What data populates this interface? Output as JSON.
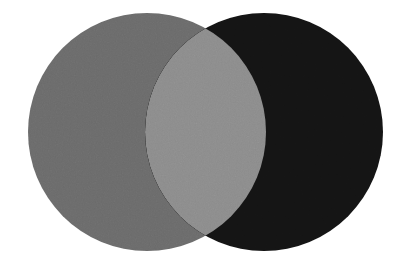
{
  "figure": {
    "background_color": "#ffffff",
    "width": 395,
    "height": 263
  },
  "chart_data": {
    "type": "venn",
    "title": "",
    "subtitle": "",
    "xlabel": "",
    "ylabel": "",
    "legend_position": "none",
    "grid": false,
    "background_color": "#ffffff",
    "sets": [
      {
        "name": "left-set",
        "label": "",
        "center_x": 147,
        "center_y": 132,
        "radius": 119,
        "color": "#6b6b6b",
        "opacity": 1
      },
      {
        "name": "right-set",
        "label": "",
        "center_x": 264,
        "center_y": 132,
        "radius": 119,
        "color": "#141414",
        "opacity": 1
      }
    ],
    "intersection": {
      "name": "overlap-lens",
      "label": "",
      "color": "#8c8c8c",
      "top_cusp_x": 204,
      "top_cusp_y": 23,
      "bottom_cusp_x": 204,
      "bottom_cusp_y": 242,
      "left_extent_x": 145,
      "right_extent_x": 266
    },
    "annotations": []
  }
}
